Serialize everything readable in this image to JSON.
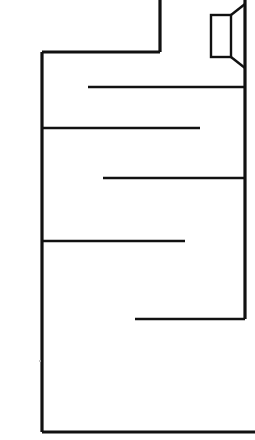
{
  "drawing": {
    "kind": "architectural-floor-plan",
    "title": "Floor Plan",
    "description": "Black line floor plan outline on white background",
    "canvas": {
      "width": 255,
      "height": 440
    },
    "colors": {
      "background": "#ffffff",
      "line": "#111111",
      "speck": "#b9b9b9"
    },
    "stroke_widths": {
      "exterior_wall": 3.2,
      "interior_partition": 2.6,
      "fixture": 2.4
    }
  },
  "geometry": {
    "exterior": {
      "label": "exterior-outline",
      "segments": [
        {
          "name": "top-stub-vertical-wall",
          "x1": 160,
          "y1": 0,
          "x2": 160,
          "y2": 52
        },
        {
          "name": "upper-left-horizontal-wall",
          "x1": 160,
          "y1": 52,
          "x2": 42,
          "y2": 52
        },
        {
          "name": "left-exterior-wall",
          "x1": 42,
          "y1": 52,
          "x2": 42,
          "y2": 432
        },
        {
          "name": "bottom-exterior-wall",
          "x1": 42,
          "y1": 432,
          "x2": 255,
          "y2": 432
        },
        {
          "name": "right-exterior-wall",
          "x1": 245,
          "y1": 0,
          "x2": 245,
          "y2": 319
        }
      ]
    },
    "partitions": [
      {
        "name": "partition-wall-upper",
        "x1": 88,
        "y1": 87,
        "x2": 245,
        "y2": 87
      },
      {
        "name": "partition-wall-second",
        "x1": 42,
        "y1": 128,
        "x2": 200,
        "y2": 128
      },
      {
        "name": "partition-wall-third",
        "x1": 103,
        "y1": 178,
        "x2": 245,
        "y2": 178
      },
      {
        "name": "partition-wall-fourth",
        "x1": 42,
        "y1": 241,
        "x2": 185,
        "y2": 241
      },
      {
        "name": "partition-wall-lower",
        "x1": 135,
        "y1": 319,
        "x2": 245,
        "y2": 319
      }
    ],
    "fixture": {
      "name": "bay-window-symbol",
      "rectangle": {
        "x": 211,
        "y": 15,
        "width": 20,
        "height": 42
      },
      "diagonals": [
        {
          "name": "bay-upper-diagonal",
          "x1": 231,
          "y1": 15,
          "x2": 245,
          "y2": 4
        },
        {
          "name": "bay-lower-diagonal",
          "x1": 231,
          "y1": 57,
          "x2": 245,
          "y2": 68
        }
      ]
    },
    "specks": [
      {
        "name": "paper-speck",
        "cx": 40,
        "cy": 361,
        "r": 1.1
      }
    ]
  }
}
